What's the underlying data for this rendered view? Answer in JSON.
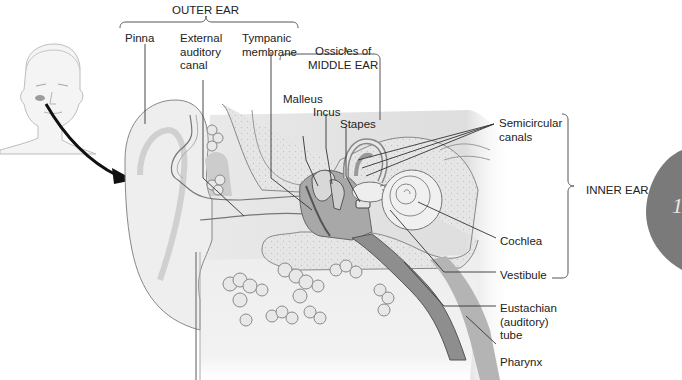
{
  "diagram": {
    "colors": {
      "background": "#ffffff",
      "label_line": "#333333",
      "tissue_light": "#eeeeee",
      "tissue_mid": "#d6d6d6",
      "tissue_dark": "#9a9a9a",
      "bone_speckle": "#e2e2e2",
      "badge": "#7a7a7a"
    },
    "groups": {
      "outer_ear": "OUTER EAR",
      "middle_ear": "Ossicles of\nMIDDLE EAR",
      "inner_ear": "INNER EAR"
    },
    "labels": {
      "pinna": "Pinna",
      "external_auditory_canal": "External\nauditory\ncanal",
      "tympanic_membrane": "Tympanic\nmembrane",
      "malleus": "Malleus",
      "incus": "Incus",
      "stapes": "Stapes",
      "semicircular_canals": "Semicircular\ncanals",
      "cochlea": "Cochlea",
      "vestibule": "Vestibule",
      "eustachian_tube": "Eustachian\n(auditory)\ntube",
      "pharynx": "Pharynx"
    },
    "badge": {
      "text": "1"
    }
  }
}
